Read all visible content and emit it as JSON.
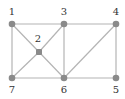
{
  "colors": {
    "edge": "#b4b4b4",
    "node": "#8a8a8a",
    "label": "#333333"
  },
  "nodes": [
    {
      "id": "1",
      "label": "1",
      "x": 12,
      "y": 24,
      "lx": 12,
      "ly": 15
    },
    {
      "id": "2",
      "label": "2",
      "x": 39,
      "y": 52,
      "lx": 38,
      "ly": 42
    },
    {
      "id": "3",
      "label": "3",
      "x": 64,
      "y": 24,
      "lx": 64,
      "ly": 15
    },
    {
      "id": "4",
      "label": "4",
      "x": 116,
      "y": 24,
      "lx": 116,
      "ly": 15
    },
    {
      "id": "5",
      "label": "5",
      "x": 116,
      "y": 78,
      "lx": 116,
      "ly": 93
    },
    {
      "id": "6",
      "label": "6",
      "x": 64,
      "y": 78,
      "lx": 64,
      "ly": 93
    },
    {
      "id": "7",
      "label": "7",
      "x": 12,
      "y": 78,
      "lx": 12,
      "ly": 93
    }
  ],
  "edges": [
    [
      "1",
      "3"
    ],
    [
      "3",
      "4"
    ],
    [
      "7",
      "6"
    ],
    [
      "6",
      "5"
    ],
    [
      "1",
      "7"
    ],
    [
      "3",
      "6"
    ],
    [
      "4",
      "5"
    ],
    [
      "1",
      "2"
    ],
    [
      "2",
      "6"
    ],
    [
      "3",
      "2"
    ],
    [
      "2",
      "7"
    ],
    [
      "4",
      "6"
    ]
  ]
}
